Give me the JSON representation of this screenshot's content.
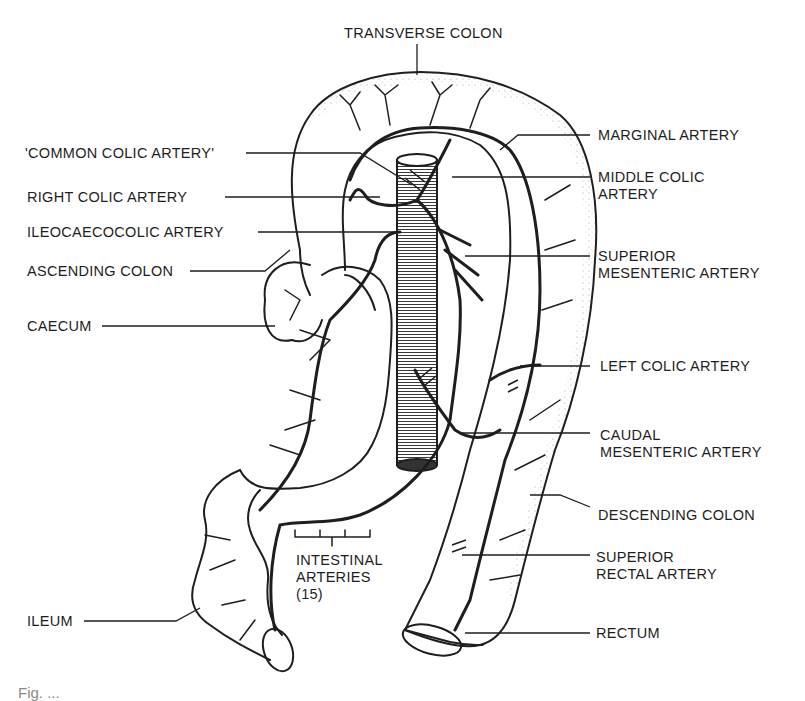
{
  "figure": {
    "type": "anatomical-illustration",
    "colors": {
      "ink": "#1e1e1e",
      "background": "#ffffff",
      "stipple": "#555555"
    },
    "labels": {
      "transverse_colon": "TRANSVERSE COLON",
      "common_colic_artery": "'COMMON COLIC ARTERY'",
      "right_colic_artery": "RIGHT COLIC ARTERY",
      "ileocaecocolic_artery": "ILEOCAECOCOLIC ARTERY",
      "ascending_colon": "ASCENDING COLON",
      "caecum": "CAECUM",
      "ileum": "ILEUM",
      "marginal_artery": "MARGINAL ARTERY",
      "middle_colic_artery": "MIDDLE COLIC\nARTERY",
      "superior_mesenteric_artery": "SUPERIOR\nMESENTERIC ARTERY",
      "left_colic_artery": "LEFT COLIC ARTERY",
      "caudal_mesenteric_artery": "CAUDAL\nMESENTERIC ARTERY",
      "descending_colon": "DESCENDING COLON",
      "superior_rectal_artery": "SUPERIOR\nRECTAL ARTERY",
      "rectum": "RECTUM",
      "intestinal_arteries": "INTESTINAL\nARTERIES\n(15)"
    },
    "caption_partial": "Fig. ..."
  }
}
